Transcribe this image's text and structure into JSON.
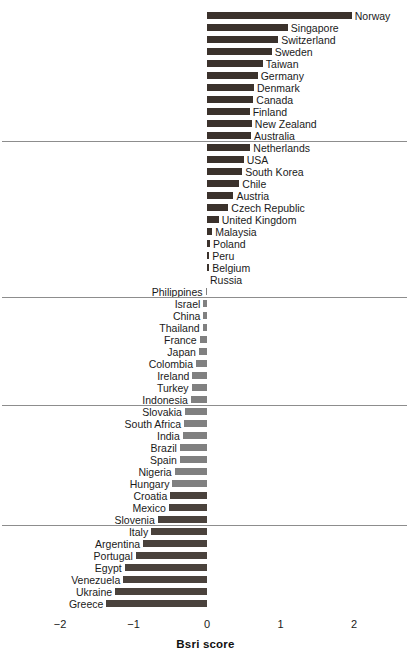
{
  "chart_data": {
    "type": "bar",
    "orientation": "horizontal",
    "title": "",
    "xlabel": "Bsri score",
    "ylabel": "",
    "xlim": [
      -2.25,
      2.3
    ],
    "xticks": [
      -2,
      -1,
      0,
      1,
      2
    ],
    "xtick_labels": [
      "−2",
      "−1",
      "0",
      "1",
      "2"
    ],
    "grid": false,
    "legend": null,
    "zero_line": 0,
    "group_separators": [
      10,
      23,
      32,
      42
    ],
    "colors": {
      "positive_bar": "#3b322c",
      "negative_bar": "#808080",
      "negative_bar_dark": "#4a423c",
      "separator": "#8d8d8d",
      "text": "#1a1a1a"
    },
    "categories": [
      "Norway",
      "Singapore",
      "Switzerland",
      "Sweden",
      "Taiwan",
      "Germany",
      "Denmark",
      "Canada",
      "Finland",
      "New Zealand",
      "Australia",
      "Netherlands",
      "USA",
      "South Korea",
      "Chile",
      "Austria",
      "Czech Republic",
      "United Kingdom",
      "Malaysia",
      "Poland",
      "Peru",
      "Belgium",
      "Russia",
      "Philippines",
      "Israel",
      "China",
      "Thailand",
      "France",
      "Japan",
      "Colombia",
      "Ireland",
      "Turkey",
      "Indonesia",
      "Slovakia",
      "South Africa",
      "India",
      "Brazil",
      "Spain",
      "Nigeria",
      "Hungary",
      "Croatia",
      "Mexico",
      "Slovenia",
      "Italy",
      "Argentina",
      "Portugal",
      "Egypt",
      "Venezuela",
      "Ukraine",
      "Greece"
    ],
    "values": [
      1.97,
      1.1,
      0.97,
      0.88,
      0.76,
      0.69,
      0.64,
      0.63,
      0.58,
      0.61,
      0.6,
      0.59,
      0.5,
      0.48,
      0.44,
      0.36,
      0.29,
      0.16,
      0.07,
      0.04,
      0.03,
      0.03,
      0.0,
      -0.02,
      -0.05,
      -0.05,
      -0.06,
      -0.1,
      -0.11,
      -0.15,
      -0.2,
      -0.21,
      -0.22,
      -0.3,
      -0.31,
      -0.33,
      -0.37,
      -0.37,
      -0.44,
      -0.47,
      -0.5,
      -0.52,
      -0.67,
      -0.76,
      -0.87,
      -0.97,
      -1.12,
      -1.14,
      -1.25,
      -1.37
    ]
  },
  "axis": {
    "title": "Bsri score",
    "tick_labels": [
      "−2",
      "−1",
      "0",
      "1",
      "2"
    ]
  }
}
